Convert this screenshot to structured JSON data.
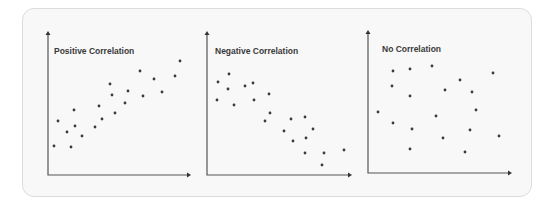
{
  "colors": {
    "card_bg": "#f8f8f8",
    "card_border": "#dcdcdc",
    "axis": "#555555",
    "dot": "#3a3a3a",
    "title": "#3a3a3a"
  },
  "chart_data": [
    {
      "type": "scatter",
      "title": "Positive Correlation",
      "xlabel": "",
      "ylabel": "",
      "grid": false,
      "axes_px": {
        "origin": [
          48,
          175
        ],
        "x_end": 191,
        "y_end": 31
      },
      "title_px": [
        54,
        54
      ],
      "points_px": [
        [
          54,
          146
        ],
        [
          58,
          121
        ],
        [
          67,
          132
        ],
        [
          71,
          147
        ],
        [
          74,
          110
        ],
        [
          75,
          126
        ],
        [
          82,
          136
        ],
        [
          95,
          127
        ],
        [
          99,
          106
        ],
        [
          102,
          119
        ],
        [
          110,
          84
        ],
        [
          112,
          95
        ],
        [
          115,
          113
        ],
        [
          125,
          103
        ],
        [
          128,
          91
        ],
        [
          140,
          71
        ],
        [
          143,
          96
        ],
        [
          154,
          79
        ],
        [
          162,
          92
        ],
        [
          175,
          76
        ],
        [
          180,
          61
        ]
      ]
    },
    {
      "type": "scatter",
      "title": "Negative Correlation",
      "xlabel": "",
      "ylabel": "",
      "grid": false,
      "axes_px": {
        "origin": [
          207,
          175
        ],
        "x_end": 352,
        "y_end": 31
      },
      "title_px": [
        215,
        54
      ],
      "points_px": [
        [
          217,
          100
        ],
        [
          218,
          82
        ],
        [
          228,
          89
        ],
        [
          229,
          74
        ],
        [
          234,
          105
        ],
        [
          245,
          86
        ],
        [
          253,
          83
        ],
        [
          254,
          100
        ],
        [
          265,
          121
        ],
        [
          269,
          94
        ],
        [
          270,
          113
        ],
        [
          284,
          131
        ],
        [
          291,
          119
        ],
        [
          293,
          141
        ],
        [
          305,
          117
        ],
        [
          306,
          138
        ],
        [
          305,
          153
        ],
        [
          313,
          129
        ],
        [
          322,
          165
        ],
        [
          324,
          153
        ],
        [
          344,
          150
        ]
      ]
    },
    {
      "type": "scatter",
      "title": "No Correlation",
      "xlabel": "",
      "ylabel": "",
      "grid": false,
      "axes_px": {
        "origin": [
          368,
          173
        ],
        "x_end": 512,
        "y_end": 30
      },
      "title_px": [
        382,
        52
      ],
      "points_px": [
        [
          378,
          112
        ],
        [
          392,
          86
        ],
        [
          393,
          71
        ],
        [
          393,
          123
        ],
        [
          410,
          69
        ],
        [
          410,
          96
        ],
        [
          410,
          149
        ],
        [
          412,
          129
        ],
        [
          432,
          66
        ],
        [
          436,
          116
        ],
        [
          443,
          138
        ],
        [
          445,
          90
        ],
        [
          460,
          80
        ],
        [
          465,
          152
        ],
        [
          470,
          130
        ],
        [
          472,
          92
        ],
        [
          476,
          110
        ],
        [
          493,
          73
        ],
        [
          499,
          136
        ]
      ]
    }
  ]
}
